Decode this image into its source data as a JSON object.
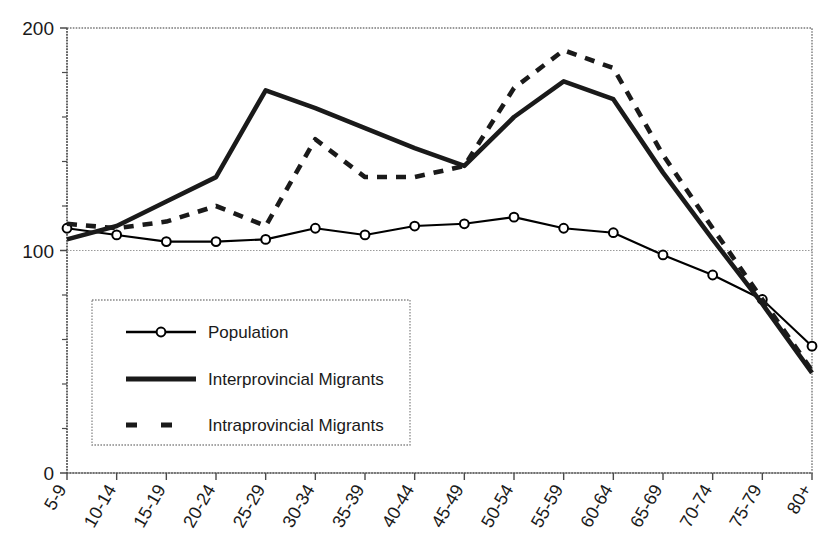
{
  "chart_data": {
    "type": "line",
    "title": "",
    "subtitle": "",
    "xlabel": "",
    "ylabel": "",
    "categories": [
      "5-9",
      "10-14",
      "15-19",
      "20-24",
      "25-29",
      "30-34",
      "35-39",
      "40-44",
      "45-49",
      "50-54",
      "55-59",
      "60-64",
      "65-69",
      "70-74",
      "75-79",
      "80+"
    ],
    "ylim": [
      0,
      200
    ],
    "y_ticks_labeled": [
      "0",
      "100",
      "200"
    ],
    "y_tick_values_labeled": [
      0,
      100,
      200
    ],
    "y_minor_tick_step": 20,
    "grid": true,
    "gridlines_at": [
      100,
      200
    ],
    "legend_position": "inside-lower-left",
    "series": [
      {
        "name": "Population",
        "style": "solid-thin-markers",
        "marker": "open-circle",
        "color": "#000000",
        "values": [
          110,
          107,
          104,
          104,
          105,
          110,
          107,
          111,
          112,
          115,
          110,
          108,
          98,
          89,
          78,
          57
        ]
      },
      {
        "name": "Interprovincial Migrants",
        "style": "solid-thick",
        "marker": "none",
        "color": "#1a1a1a",
        "values": [
          105,
          111,
          122,
          133,
          172,
          164,
          155,
          146,
          138,
          160,
          176,
          168,
          135,
          105,
          76,
          45
        ]
      },
      {
        "name": "Intraprovincial Migrants",
        "style": "dashed-thick",
        "marker": "none",
        "color": "#1a1a1a",
        "values": [
          112,
          110,
          113,
          120,
          111,
          150,
          133,
          133,
          138,
          173,
          190,
          182,
          143,
          110,
          78,
          46
        ]
      }
    ]
  },
  "axes": {
    "y_labels": [
      "200",
      "100",
      "0"
    ],
    "x_labels": [
      "5-9",
      "10-14",
      "15-19",
      "20-24",
      "25-29",
      "30-34",
      "35-39",
      "40-44",
      "45-49",
      "50-54",
      "55-59",
      "60-64",
      "65-69",
      "70-74",
      "75-79",
      "80+"
    ]
  },
  "legend": {
    "items": [
      {
        "label": "Population",
        "key": "population"
      },
      {
        "label": "Interprovincial Migrants",
        "key": "interprovincial"
      },
      {
        "label": "Intraprovincial Migrants",
        "key": "intraprovincial"
      }
    ]
  }
}
